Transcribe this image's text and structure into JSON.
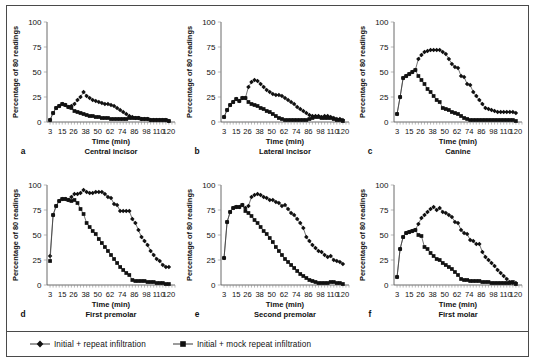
{
  "figure": {
    "title": "",
    "legend": {
      "entries": [
        {
          "label": "Initial + repeat infiltration",
          "marker": "diamond",
          "color": "#111111"
        },
        {
          "label": "Initial + mock repeat infiltration",
          "marker": "square",
          "color": "#111111"
        }
      ]
    },
    "axis": {
      "xlabel": "Time (min)",
      "ylabel": "Percentage of 80 readings",
      "xticks": [
        3,
        15,
        26,
        38,
        50,
        62,
        74,
        86,
        98,
        110,
        120
      ],
      "yticks": [
        0,
        25,
        50,
        75,
        100
      ],
      "xlim": [
        0,
        126
      ],
      "ylim": [
        0,
        100
      ]
    },
    "panels": [
      {
        "letter": "a",
        "subtitle": "Central incisor"
      },
      {
        "letter": "b",
        "subtitle": "Lateral incisor"
      },
      {
        "letter": "c",
        "subtitle": "Canine"
      },
      {
        "letter": "d",
        "subtitle": "First premolar"
      },
      {
        "letter": "e",
        "subtitle": "Second premolar"
      },
      {
        "letter": "f",
        "subtitle": "First molar"
      }
    ]
  },
  "chart_data": [
    {
      "type": "line",
      "panel": "a",
      "title": "Central incisor",
      "xlabel": "Time (min)",
      "ylabel": "Percentage of 80 readings",
      "xlim": [
        0,
        126
      ],
      "ylim": [
        0,
        100
      ],
      "xticks": [
        3,
        15,
        26,
        38,
        50,
        62,
        74,
        86,
        98,
        110,
        120
      ],
      "yticks": [
        0,
        25,
        50,
        75,
        100
      ],
      "grid": false,
      "legend_position": "below-figure",
      "x": [
        3,
        6,
        9,
        12,
        15,
        18,
        21,
        24,
        27,
        30,
        33,
        36,
        39,
        42,
        45,
        48,
        51,
        54,
        57,
        60,
        63,
        66,
        69,
        72,
        75,
        78,
        81,
        84,
        87,
        90,
        93,
        96,
        99,
        102,
        105,
        108,
        111,
        114,
        117,
        120
      ],
      "series": [
        {
          "name": "Initial + repeat infiltration",
          "marker": "diamond",
          "values": [
            2,
            9,
            14,
            16,
            18,
            17,
            15,
            16,
            18,
            22,
            25,
            30,
            26,
            24,
            22,
            21,
            20,
            19,
            18,
            18,
            17,
            16,
            14,
            12,
            10,
            8,
            6,
            5,
            4,
            4,
            3,
            3,
            3,
            2,
            2,
            2,
            2,
            2,
            2,
            1
          ]
        },
        {
          "name": "Initial + mock repeat infiltration",
          "marker": "square",
          "values": [
            2,
            9,
            14,
            16,
            18,
            17,
            15,
            14,
            11,
            10,
            9,
            8,
            7,
            6,
            6,
            5,
            5,
            4,
            4,
            4,
            3,
            3,
            3,
            3,
            3,
            3,
            4,
            4,
            4,
            4,
            3,
            3,
            3,
            2,
            2,
            2,
            2,
            2,
            2,
            1
          ]
        }
      ]
    },
    {
      "type": "line",
      "panel": "b",
      "title": "Lateral incisor",
      "xlabel": "Time (min)",
      "ylabel": "Percentage of 80 readings",
      "xlim": [
        0,
        126
      ],
      "ylim": [
        0,
        100
      ],
      "xticks": [
        3,
        15,
        26,
        38,
        50,
        62,
        74,
        86,
        98,
        110,
        120
      ],
      "yticks": [
        0,
        25,
        50,
        75,
        100
      ],
      "grid": false,
      "legend_position": "below-figure",
      "x": [
        3,
        6,
        9,
        12,
        15,
        18,
        21,
        24,
        27,
        30,
        33,
        36,
        39,
        42,
        45,
        48,
        51,
        54,
        57,
        60,
        63,
        66,
        69,
        72,
        75,
        78,
        81,
        84,
        87,
        90,
        93,
        96,
        99,
        102,
        105,
        108,
        111,
        114,
        117,
        120
      ],
      "series": [
        {
          "name": "Initial + repeat infiltration",
          "marker": "diamond",
          "values": [
            5,
            12,
            17,
            20,
            23,
            21,
            24,
            24,
            35,
            40,
            42,
            41,
            38,
            35,
            32,
            30,
            28,
            27,
            27,
            26,
            24,
            22,
            20,
            18,
            15,
            13,
            11,
            9,
            7,
            6,
            6,
            6,
            5,
            6,
            6,
            5,
            4,
            3,
            3,
            2
          ]
        },
        {
          "name": "Initial + mock repeat infiltration",
          "marker": "square",
          "values": [
            5,
            12,
            17,
            20,
            23,
            21,
            24,
            24,
            20,
            18,
            17,
            16,
            14,
            13,
            11,
            10,
            8,
            6,
            4,
            3,
            2,
            2,
            2,
            2,
            2,
            2,
            2,
            2,
            3,
            4,
            5,
            5,
            4,
            4,
            4,
            4,
            3,
            2,
            2,
            1
          ]
        }
      ]
    },
    {
      "type": "line",
      "panel": "c",
      "title": "Canine",
      "xlabel": "Time (min)",
      "ylabel": "Percentage of 80 readings",
      "xlim": [
        0,
        126
      ],
      "ylim": [
        0,
        100
      ],
      "xticks": [
        3,
        15,
        26,
        38,
        50,
        62,
        74,
        86,
        98,
        110,
        120
      ],
      "yticks": [
        0,
        25,
        50,
        75,
        100
      ],
      "grid": false,
      "legend_position": "below-figure",
      "x": [
        3,
        6,
        9,
        12,
        15,
        18,
        21,
        24,
        27,
        30,
        33,
        36,
        39,
        42,
        45,
        48,
        51,
        54,
        57,
        60,
        63,
        66,
        69,
        72,
        75,
        78,
        81,
        84,
        87,
        90,
        93,
        96,
        99,
        102,
        105,
        108,
        111,
        114,
        117,
        120
      ],
      "series": [
        {
          "name": "Initial + repeat infiltration",
          "marker": "diamond",
          "values": [
            8,
            25,
            44,
            46,
            48,
            50,
            52,
            63,
            67,
            70,
            71,
            72,
            72,
            72,
            72,
            70,
            68,
            63,
            58,
            55,
            54,
            46,
            45,
            38,
            37,
            30,
            26,
            22,
            18,
            14,
            13,
            12,
            11,
            10,
            10,
            10,
            10,
            10,
            10,
            9
          ]
        },
        {
          "name": "Initial + mock repeat infiltration",
          "marker": "square",
          "values": [
            8,
            25,
            44,
            46,
            48,
            50,
            52,
            46,
            42,
            38,
            33,
            30,
            26,
            22,
            20,
            14,
            13,
            12,
            10,
            9,
            8,
            6,
            4,
            3,
            2,
            2,
            2,
            2,
            2,
            2,
            2,
            2,
            2,
            2,
            2,
            2,
            2,
            2,
            2,
            1
          ]
        }
      ]
    },
    {
      "type": "line",
      "panel": "d",
      "title": "First premolar",
      "xlabel": "Time (min)",
      "ylabel": "Percentage of 80 readings",
      "xlim": [
        0,
        126
      ],
      "ylim": [
        0,
        100
      ],
      "xticks": [
        3,
        15,
        26,
        38,
        50,
        62,
        74,
        86,
        98,
        110,
        120
      ],
      "yticks": [
        0,
        25,
        50,
        75,
        100
      ],
      "grid": false,
      "legend_position": "below-figure",
      "x": [
        3,
        6,
        9,
        12,
        15,
        18,
        21,
        24,
        27,
        30,
        33,
        36,
        39,
        42,
        45,
        48,
        51,
        54,
        57,
        60,
        63,
        66,
        69,
        72,
        75,
        78,
        81,
        84,
        87,
        90,
        93,
        96,
        99,
        102,
        105,
        108,
        111,
        114,
        117,
        120
      ],
      "series": [
        {
          "name": "Initial + repeat infiltration",
          "marker": "diamond",
          "values": [
            29,
            70,
            79,
            84,
            86,
            86,
            85,
            88,
            91,
            91,
            92,
            95,
            93,
            92,
            92,
            93,
            93,
            93,
            91,
            88,
            87,
            81,
            80,
            74,
            74,
            74,
            74,
            66,
            62,
            55,
            48,
            44,
            40,
            34,
            30,
            26,
            24,
            20,
            18,
            18
          ]
        },
        {
          "name": "Initial + mock repeat infiltration",
          "marker": "square",
          "values": [
            24,
            70,
            79,
            84,
            86,
            86,
            85,
            84,
            85,
            82,
            76,
            71,
            62,
            58,
            54,
            51,
            46,
            42,
            38,
            34,
            30,
            26,
            22,
            18,
            15,
            12,
            10,
            5,
            4,
            4,
            4,
            4,
            3,
            3,
            3,
            2,
            2,
            2,
            1,
            1
          ]
        }
      ]
    },
    {
      "type": "line",
      "panel": "e",
      "title": "Second premolar",
      "xlabel": "Time (min)",
      "ylabel": "Percentage of 80 readings",
      "xlim": [
        0,
        126
      ],
      "ylim": [
        0,
        100
      ],
      "xticks": [
        3,
        15,
        26,
        38,
        50,
        62,
        74,
        86,
        98,
        110,
        120
      ],
      "yticks": [
        0,
        25,
        50,
        75,
        100
      ],
      "grid": false,
      "legend_position": "below-figure",
      "x": [
        3,
        6,
        9,
        12,
        15,
        18,
        21,
        24,
        27,
        30,
        33,
        36,
        39,
        42,
        45,
        48,
        51,
        54,
        57,
        60,
        63,
        66,
        69,
        72,
        75,
        78,
        81,
        84,
        87,
        90,
        93,
        96,
        99,
        102,
        105,
        108,
        111,
        114,
        117,
        120
      ],
      "series": [
        {
          "name": "Initial + repeat infiltration",
          "marker": "diamond",
          "values": [
            27,
            63,
            73,
            77,
            78,
            78,
            80,
            77,
            79,
            88,
            90,
            91,
            90,
            88,
            87,
            85,
            85,
            83,
            82,
            79,
            80,
            76,
            72,
            70,
            66,
            62,
            57,
            48,
            44,
            40,
            37,
            34,
            33,
            30,
            28,
            29,
            25,
            24,
            23,
            21
          ]
        },
        {
          "name": "Initial + mock repeat infiltration",
          "marker": "square",
          "values": [
            27,
            63,
            73,
            77,
            78,
            78,
            80,
            74,
            72,
            69,
            65,
            62,
            58,
            54,
            51,
            47,
            43,
            38,
            34,
            30,
            26,
            23,
            20,
            17,
            14,
            11,
            9,
            7,
            5,
            4,
            3,
            2,
            2,
            2,
            2,
            3,
            3,
            2,
            2,
            1
          ]
        }
      ]
    },
    {
      "type": "line",
      "panel": "f",
      "title": "First molar",
      "xlabel": "Time (min)",
      "ylabel": "Percentage of 80 readings",
      "xlim": [
        0,
        126
      ],
      "ylim": [
        0,
        100
      ],
      "xticks": [
        3,
        15,
        26,
        38,
        50,
        62,
        74,
        86,
        98,
        110,
        120
      ],
      "yticks": [
        0,
        25,
        50,
        75,
        100
      ],
      "grid": false,
      "legend_position": "below-figure",
      "x": [
        3,
        6,
        9,
        12,
        15,
        18,
        21,
        24,
        27,
        30,
        33,
        36,
        39,
        42,
        45,
        48,
        51,
        54,
        57,
        60,
        63,
        66,
        69,
        72,
        75,
        78,
        81,
        84,
        87,
        90,
        93,
        96,
        99,
        102,
        105,
        108,
        111,
        114,
        117,
        120
      ],
      "series": [
        {
          "name": "Initial + repeat infiltration",
          "marker": "diamond",
          "values": [
            8,
            36,
            48,
            52,
            53,
            54,
            55,
            61,
            67,
            70,
            73,
            76,
            78,
            75,
            77,
            73,
            72,
            70,
            68,
            63,
            62,
            55,
            52,
            51,
            45,
            44,
            41,
            41,
            33,
            28,
            25,
            22,
            19,
            15,
            12,
            9,
            6,
            3,
            2,
            2
          ]
        },
        {
          "name": "Initial + mock repeat infiltration",
          "marker": "square",
          "values": [
            8,
            36,
            48,
            52,
            53,
            54,
            55,
            50,
            49,
            38,
            36,
            32,
            29,
            26,
            25,
            22,
            20,
            18,
            16,
            13,
            10,
            6,
            5,
            5,
            4,
            4,
            4,
            4,
            3,
            3,
            3,
            2,
            2,
            2,
            2,
            2,
            2,
            2,
            3,
            1
          ]
        }
      ]
    }
  ]
}
